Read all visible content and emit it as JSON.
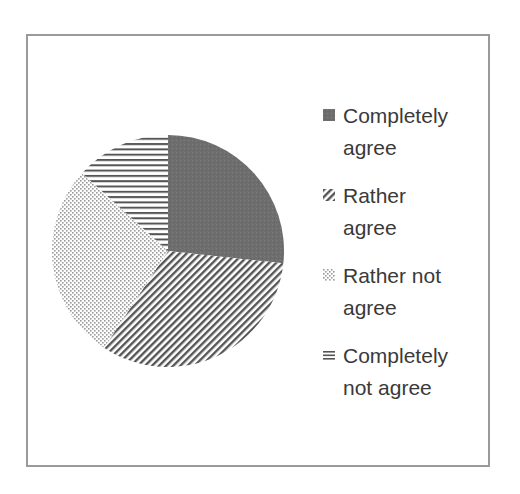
{
  "chart_data": {
    "type": "pie",
    "title": "",
    "categories": [
      "Completely agree",
      "Rather agree",
      "Rather not agree",
      "Completely not agree"
    ],
    "values": [
      26.7,
      32.6,
      27.4,
      13.3
    ],
    "unit": "%",
    "start_angle_deg": 0,
    "direction": "clockwise",
    "legend_position": "right",
    "patterns": [
      "solid-gray",
      "diagonal-stripes",
      "dots",
      "horizontal-stripes"
    ]
  },
  "legend": {
    "items": [
      {
        "line1": "Completely",
        "line2": "agree",
        "icon": "solid-square-icon"
      },
      {
        "line1": "Rather",
        "line2": "agree",
        "icon": "diagonal-hatch-icon"
      },
      {
        "line1": "Rather not",
        "line2": "agree",
        "icon": "dotted-pattern-icon"
      },
      {
        "line1": "Completely",
        "line2": "not agree",
        "icon": "horizontal-lines-icon"
      }
    ]
  },
  "colors": {
    "solid": "#707070",
    "hatch": "#555555",
    "dots": "#9a9a9a",
    "border": "#9a9a9a",
    "text": "#3a3a3a"
  }
}
